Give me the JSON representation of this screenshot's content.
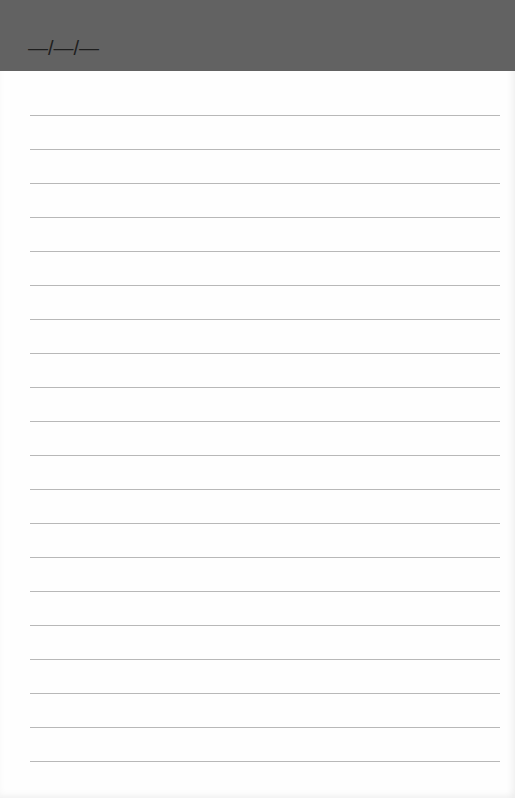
{
  "header": {
    "date_placeholder": "—/—/—",
    "background_color": "#626262"
  },
  "page": {
    "line_count": 20,
    "first_line_y": 115,
    "line_spacing": 34,
    "line_color": "#b8b8b8"
  }
}
